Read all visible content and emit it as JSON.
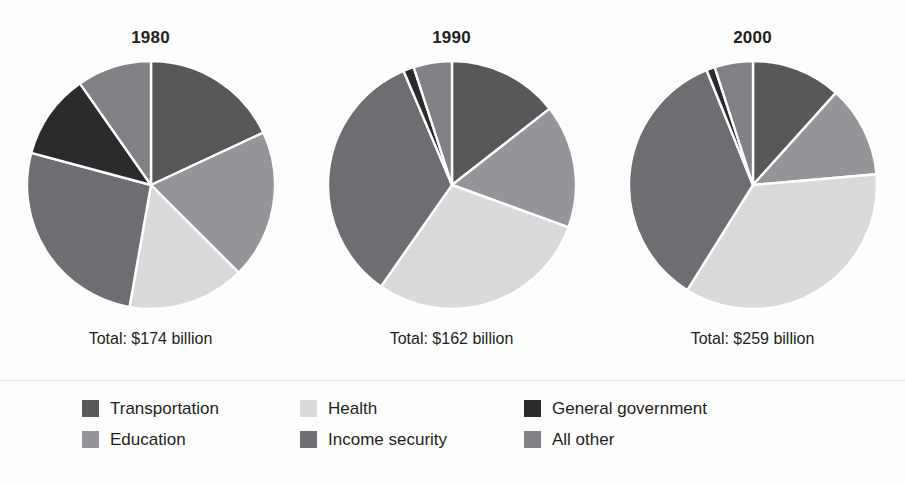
{
  "figure": {
    "background": "#fdfdfd",
    "divider_color": "#e2e2e2"
  },
  "legend": {
    "columns": [
      [
        {
          "label": "Transportation",
          "color": "#57585a",
          "key": "transportation"
        },
        {
          "label": "Education",
          "color": "#939598",
          "key": "education"
        }
      ],
      [
        {
          "label": "Health",
          "color": "#d9dadb",
          "key": "health"
        },
        {
          "label": "Income security",
          "color": "#6d6e71",
          "key": "income_security"
        }
      ],
      [
        {
          "label": "General government",
          "color": "#2b2b2d",
          "key": "general_government"
        },
        {
          "label": "All other",
          "color": "#808285",
          "key": "all_other"
        }
      ]
    ]
  },
  "chart_data": {
    "type": "pie",
    "title": "",
    "subtitle": "",
    "xlabel": "",
    "ylabel": "",
    "legend_position": "bottom",
    "grid": false,
    "units": "billions of dollars",
    "categories": [
      "Transportation",
      "Education",
      "Health",
      "Income security",
      "General government",
      "All other"
    ],
    "category_colors": {
      "Transportation": "#57585a",
      "Education": "#939598",
      "Health": "#d9dadb",
      "Income security": "#6d6e71",
      "General government": "#2b2b2d",
      "All other": "#808285"
    },
    "charts": [
      {
        "id": "pie-1980",
        "title": "1980",
        "total_label": "Total: $174 billion",
        "total_value": 174,
        "slices": [
          {
            "name": "Transportation",
            "percent": 18.0,
            "start_deg": 0,
            "end_deg": 65,
            "color": "#57585a"
          },
          {
            "name": "Education",
            "percent": 19.4,
            "start_deg": 65,
            "end_deg": 135,
            "color": "#939598"
          },
          {
            "name": "Health",
            "percent": 15.3,
            "start_deg": 135,
            "end_deg": 190,
            "color": "#d9dadb"
          },
          {
            "name": "Income security",
            "percent": 26.4,
            "start_deg": 190,
            "end_deg": 285,
            "color": "#6d6e71"
          },
          {
            "name": "General government",
            "percent": 11.1,
            "start_deg": 285,
            "end_deg": 325,
            "color": "#2b2b2d"
          },
          {
            "name": "All other",
            "percent": 9.8,
            "start_deg": 325,
            "end_deg": 360,
            "color": "#808285"
          }
        ]
      },
      {
        "id": "pie-1990",
        "title": "1990",
        "total_label": "Total: $162 billion",
        "total_value": 162,
        "slices": [
          {
            "name": "Transportation",
            "percent": 14.4,
            "start_deg": 0,
            "end_deg": 52,
            "color": "#57585a"
          },
          {
            "name": "Education",
            "percent": 16.1,
            "start_deg": 52,
            "end_deg": 110,
            "color": "#939598"
          },
          {
            "name": "Health",
            "percent": 29.2,
            "start_deg": 110,
            "end_deg": 215,
            "color": "#d9dadb"
          },
          {
            "name": "Income security",
            "percent": 33.9,
            "start_deg": 215,
            "end_deg": 337,
            "color": "#6d6e71"
          },
          {
            "name": "General government",
            "percent": 1.4,
            "start_deg": 337,
            "end_deg": 342,
            "color": "#2b2b2d"
          },
          {
            "name": "All other",
            "percent": 5.0,
            "start_deg": 342,
            "end_deg": 360,
            "color": "#808285"
          }
        ]
      },
      {
        "id": "pie-2000",
        "title": "2000",
        "total_label": "Total: $259 billion",
        "total_value": 259,
        "slices": [
          {
            "name": "Transportation",
            "percent": 11.7,
            "start_deg": 0,
            "end_deg": 42,
            "color": "#57585a"
          },
          {
            "name": "Education",
            "percent": 11.9,
            "start_deg": 42,
            "end_deg": 85,
            "color": "#939598"
          },
          {
            "name": "Health",
            "percent": 35.3,
            "start_deg": 85,
            "end_deg": 212,
            "color": "#d9dadb"
          },
          {
            "name": "Income security",
            "percent": 35.0,
            "start_deg": 212,
            "end_deg": 338,
            "color": "#6d6e71"
          },
          {
            "name": "General government",
            "percent": 1.1,
            "start_deg": 338,
            "end_deg": 342,
            "color": "#2b2b2d"
          },
          {
            "name": "All other",
            "percent": 5.0,
            "start_deg": 342,
            "end_deg": 360,
            "color": "#808285"
          }
        ]
      }
    ]
  }
}
